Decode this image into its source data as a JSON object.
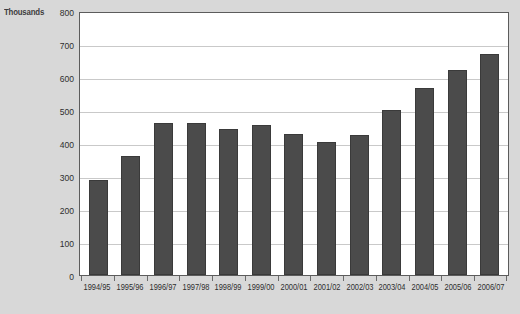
{
  "chart_data": {
    "type": "bar",
    "title": "",
    "subtitle": "",
    "xlabel": "",
    "ylabel": "Thousands",
    "ylim": [
      0,
      800
    ],
    "ytick_step": 100,
    "yticks": [
      800,
      700,
      600,
      500,
      400,
      300,
      200,
      100,
      0
    ],
    "grid": true,
    "legend": null,
    "categories": [
      "1994/95",
      "1995/96",
      "1996/97",
      "1997/98",
      "1998/99",
      "1999/00",
      "2000/01",
      "2001/02",
      "2002/03",
      "2003/04",
      "2004/05",
      "2005/06",
      "2006/07"
    ],
    "values": [
      288,
      360,
      460,
      460,
      443,
      455,
      428,
      403,
      423,
      500,
      567,
      622,
      670
    ],
    "bar_color": "#4b4b4b",
    "plot_background": "#ffffff",
    "figure_background": "#d8d8d8",
    "gridline_color": "#c9c9c9",
    "axis_color": "#5c5c5c",
    "text_color": "#2e2e2e"
  }
}
